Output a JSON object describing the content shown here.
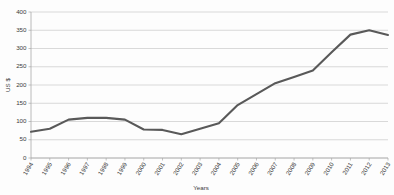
{
  "chart_data": {
    "type": "line",
    "title": "",
    "xlabel": "Years",
    "ylabel": "US $",
    "ylim": [
      0,
      400
    ],
    "ytick_step": 50,
    "yticks": [
      "0",
      "50",
      "100",
      "150",
      "200",
      "250",
      "300",
      "350",
      "400"
    ],
    "grid": true,
    "legend": false,
    "legend_position": "none",
    "line_color": "#595959",
    "grid_color": "#c9c9c9",
    "axis_color": "#a8a8a8",
    "categories": [
      "1994",
      "1995",
      "1996",
      "1997",
      "1998",
      "1999",
      "2000",
      "2001",
      "2002",
      "2003",
      "2004",
      "2005",
      "2006",
      "2007",
      "2008",
      "2009",
      "2010",
      "2011",
      "2012",
      "2013"
    ],
    "series": [
      {
        "name": "US $",
        "values": [
          72,
          80,
          105,
          110,
          110,
          105,
          78,
          77,
          65,
          80,
          95,
          145,
          175,
          205,
          222,
          240,
          290,
          338,
          350,
          337
        ]
      }
    ]
  }
}
